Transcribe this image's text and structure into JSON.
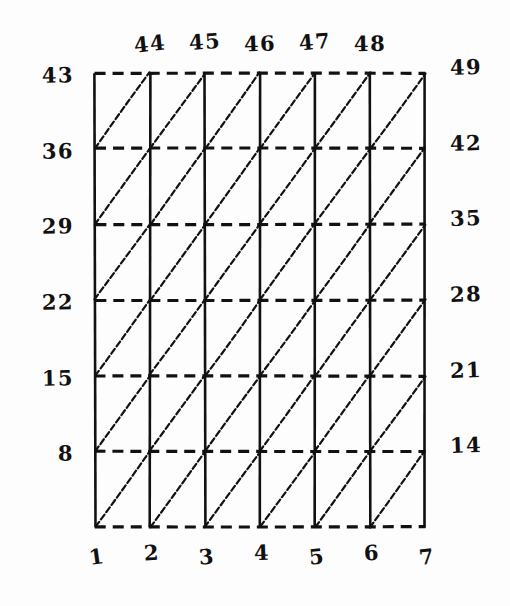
{
  "diagram": {
    "ink_color": "#111111",
    "paper_color": "#fdfdfd",
    "grid": {
      "columns": 6,
      "rows": 6,
      "vertical_line_style": "solid",
      "horizontal_line_style": "dashed",
      "diagonal_direction": "bottom-left-to-top-right",
      "left_x": 95,
      "right_x": 425,
      "top_y": 73,
      "bottom_y": 527,
      "column_step": 55,
      "row_step": 75.7
    }
  },
  "labels": {
    "top": [
      "44",
      "45",
      "46",
      "47",
      "48"
    ],
    "bottom": [
      "1",
      "2",
      "3",
      "4",
      "5",
      "6",
      "7"
    ],
    "left": [
      "43",
      "36",
      "29",
      "22",
      "15",
      "8"
    ],
    "right": [
      "49",
      "42",
      "35",
      "28",
      "21",
      "14"
    ],
    "top_corner_left": "43",
    "top_corner_right": "49"
  },
  "chart_data": {
    "type": "table",
    "xlabel": "column index",
    "ylabel": "row node number",
    "columns": [
      "1",
      "2",
      "3",
      "4",
      "5",
      "6",
      "7"
    ],
    "top_row_nodes": [
      "43",
      "44",
      "45",
      "46",
      "47",
      "48",
      "49"
    ],
    "left_edge_nodes": [
      "43",
      "36",
      "29",
      "22",
      "15",
      "8"
    ],
    "right_edge_nodes": [
      "49",
      "42",
      "35",
      "28",
      "21",
      "14"
    ],
    "node_step_per_column": 1,
    "node_step_per_row": 7
  }
}
